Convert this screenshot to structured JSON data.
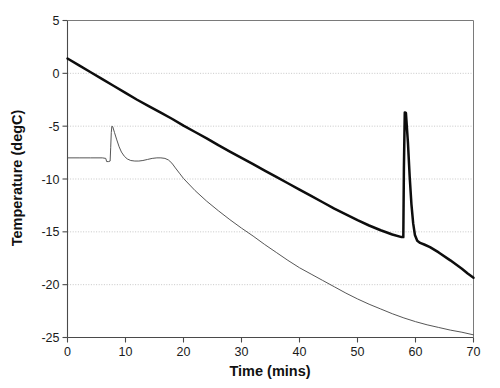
{
  "chart_data": {
    "type": "line",
    "title": "",
    "xlabel": "Time (mins)",
    "ylabel": "Temperature (degC)",
    "xlim": [
      0,
      70
    ],
    "ylim": [
      -25,
      5
    ],
    "xticks": [
      0,
      10,
      20,
      30,
      40,
      50,
      60,
      70
    ],
    "yticks": [
      5,
      0,
      -5,
      -10,
      -15,
      -20,
      -25
    ],
    "grid": true,
    "grid_axis": "y",
    "legend": "none",
    "colors": {
      "thick_series": "#0d0d0d",
      "thin_series": "#4d4d4d",
      "gridline": "#b9b9b9",
      "axis": "#4a4a4a",
      "background": "#ffffff"
    },
    "series": [
      {
        "name": "bath-temperature",
        "style": "thick",
        "annotation": "Near-linear cooling ramp with a sharp exotherm spike at about 58 min",
        "points": [
          [
            0.0,
            1.4
          ],
          [
            2.0,
            0.75
          ],
          [
            4.0,
            0.1
          ],
          [
            6.0,
            -0.55
          ],
          [
            8.0,
            -1.2
          ],
          [
            10.0,
            -1.85
          ],
          [
            12.0,
            -2.5
          ],
          [
            14.0,
            -3.1
          ],
          [
            16.0,
            -3.7
          ],
          [
            18.0,
            -4.3
          ],
          [
            20.0,
            -4.95
          ],
          [
            22.0,
            -5.55
          ],
          [
            24.0,
            -6.15
          ],
          [
            26.0,
            -6.8
          ],
          [
            28.0,
            -7.4
          ],
          [
            30.0,
            -8.0
          ],
          [
            32.0,
            -8.6
          ],
          [
            34.0,
            -9.2
          ],
          [
            36.0,
            -9.8
          ],
          [
            38.0,
            -10.4
          ],
          [
            40.0,
            -11.0
          ],
          [
            42.0,
            -11.6
          ],
          [
            44.0,
            -12.2
          ],
          [
            46.0,
            -12.8
          ],
          [
            48.0,
            -13.35
          ],
          [
            50.0,
            -13.9
          ],
          [
            52.0,
            -14.4
          ],
          [
            54.0,
            -14.85
          ],
          [
            56.0,
            -15.25
          ],
          [
            57.6,
            -15.5
          ],
          [
            57.9,
            -15.5
          ],
          [
            58.0,
            -9.0
          ],
          [
            58.15,
            -3.7
          ],
          [
            58.35,
            -3.75
          ],
          [
            58.7,
            -6.6
          ],
          [
            59.0,
            -9.8
          ],
          [
            59.3,
            -12.4
          ],
          [
            59.6,
            -14.2
          ],
          [
            59.9,
            -15.3
          ],
          [
            60.3,
            -15.85
          ],
          [
            60.8,
            -16.05
          ],
          [
            61.5,
            -16.2
          ],
          [
            62.5,
            -16.45
          ],
          [
            64.0,
            -16.95
          ],
          [
            66.0,
            -17.7
          ],
          [
            68.0,
            -18.5
          ],
          [
            69.0,
            -18.95
          ],
          [
            70.0,
            -19.35
          ]
        ]
      },
      {
        "name": "sample-temperature",
        "style": "thin",
        "annotation": "Supercooled plateau near -8 degC, nucleation spike to -5 degC at about 7.6 min, recalescence plateau, then linear cooling to -24.7 degC",
        "points": [
          [
            0.0,
            -8.0
          ],
          [
            2.0,
            -8.0
          ],
          [
            4.0,
            -8.0
          ],
          [
            6.0,
            -8.0
          ],
          [
            6.6,
            -8.05
          ],
          [
            6.75,
            -8.35
          ],
          [
            7.1,
            -8.35
          ],
          [
            7.35,
            -8.3
          ],
          [
            7.45,
            -7.0
          ],
          [
            7.55,
            -5.6
          ],
          [
            7.65,
            -5.0
          ],
          [
            7.8,
            -5.05
          ],
          [
            8.1,
            -5.6
          ],
          [
            8.5,
            -6.3
          ],
          [
            8.9,
            -6.95
          ],
          [
            9.3,
            -7.45
          ],
          [
            9.8,
            -7.85
          ],
          [
            10.3,
            -8.1
          ],
          [
            10.9,
            -8.25
          ],
          [
            11.6,
            -8.3
          ],
          [
            12.3,
            -8.3
          ],
          [
            13.0,
            -8.25
          ],
          [
            13.8,
            -8.15
          ],
          [
            14.6,
            -8.05
          ],
          [
            15.4,
            -8.0
          ],
          [
            16.1,
            -8.0
          ],
          [
            16.8,
            -8.05
          ],
          [
            17.4,
            -8.2
          ],
          [
            18.0,
            -8.5
          ],
          [
            18.6,
            -8.95
          ],
          [
            19.3,
            -9.45
          ],
          [
            20.0,
            -9.95
          ],
          [
            22.0,
            -11.1
          ],
          [
            24.0,
            -12.1
          ],
          [
            26.0,
            -13.0
          ],
          [
            28.0,
            -13.85
          ],
          [
            30.0,
            -14.65
          ],
          [
            32.0,
            -15.4
          ],
          [
            34.0,
            -16.2
          ],
          [
            36.0,
            -16.95
          ],
          [
            38.0,
            -17.7
          ],
          [
            40.0,
            -18.4
          ],
          [
            42.0,
            -19.0
          ],
          [
            44.0,
            -19.6
          ],
          [
            46.0,
            -20.2
          ],
          [
            48.0,
            -20.8
          ],
          [
            50.0,
            -21.35
          ],
          [
            52.0,
            -21.85
          ],
          [
            54.0,
            -22.3
          ],
          [
            56.0,
            -22.75
          ],
          [
            58.0,
            -23.15
          ],
          [
            60.0,
            -23.5
          ],
          [
            62.0,
            -23.8
          ],
          [
            64.0,
            -24.05
          ],
          [
            66.0,
            -24.3
          ],
          [
            68.0,
            -24.5
          ],
          [
            70.0,
            -24.75
          ]
        ]
      }
    ]
  }
}
